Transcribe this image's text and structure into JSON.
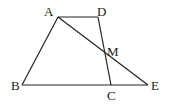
{
  "diagram": {
    "type": "geometry",
    "points": {
      "A": {
        "label": "A",
        "x": 58,
        "y": 17
      },
      "D": {
        "label": "D",
        "x": 98,
        "y": 17
      },
      "B": {
        "label": "B",
        "x": 22,
        "y": 85
      },
      "C": {
        "label": "C",
        "x": 111,
        "y": 85
      },
      "E": {
        "label": "E",
        "x": 148,
        "y": 85
      },
      "M": {
        "label": "M",
        "x": 104,
        "y": 50
      }
    },
    "segments": [
      "AD",
      "AB",
      "BE",
      "DC",
      "AE"
    ],
    "colors": {
      "stroke": "#222222",
      "background": "#ffffff"
    }
  }
}
